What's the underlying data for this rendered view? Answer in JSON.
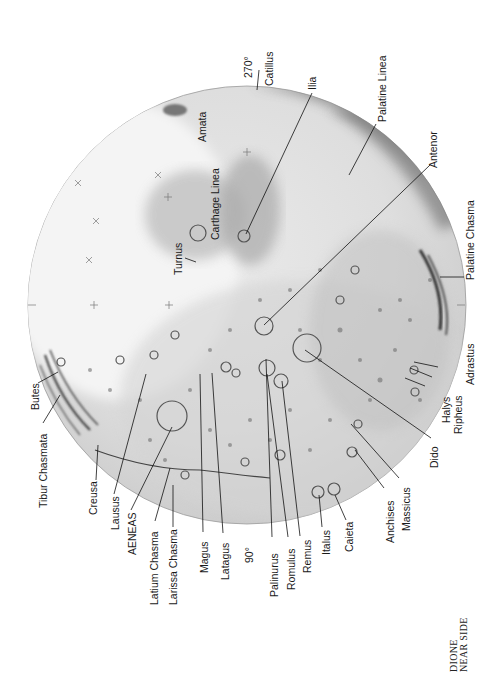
{
  "map": {
    "title_lines": [
      "DIONE",
      "NEAR SIDE"
    ],
    "body": "Dione",
    "orientation_note": "labels rotated 90° counter-clockwise",
    "longitude_marks": [
      {
        "id": "lon-270",
        "label": "270°"
      },
      {
        "id": "lon-90",
        "label": "90°"
      }
    ],
    "features": [
      {
        "id": "catillus",
        "label": "Catillus"
      },
      {
        "id": "ilia",
        "label": "Ilia"
      },
      {
        "id": "palatine-linea",
        "label": "Palatine Linea"
      },
      {
        "id": "antenor",
        "label": "Antenor"
      },
      {
        "id": "palatine-chasma",
        "label": "Palatine Chasma"
      },
      {
        "id": "adrastus",
        "label": "Adrastus"
      },
      {
        "id": "ripheus",
        "label": "Ripheus"
      },
      {
        "id": "halys",
        "label": "Halys"
      },
      {
        "id": "dido",
        "label": "Dido"
      },
      {
        "id": "massicus",
        "label": "Massicus"
      },
      {
        "id": "anchises",
        "label": "Anchises"
      },
      {
        "id": "caieta",
        "label": "Caieta"
      },
      {
        "id": "italus",
        "label": "Italus"
      },
      {
        "id": "remus",
        "label": "Remus"
      },
      {
        "id": "romulus",
        "label": "Romulus"
      },
      {
        "id": "palinurus",
        "label": "Palinurus"
      },
      {
        "id": "latagus",
        "label": "Latagus"
      },
      {
        "id": "magus",
        "label": "Magus"
      },
      {
        "id": "larissa-chasma",
        "label": "Larissa Chasma"
      },
      {
        "id": "latium-chasma",
        "label": "Latium Chasma"
      },
      {
        "id": "aeneas",
        "label": "AENEAS"
      },
      {
        "id": "lausus",
        "label": "Lausus"
      },
      {
        "id": "creusa",
        "label": "Creusa"
      },
      {
        "id": "tibur-chasmata",
        "label": "Tibur Chasmata"
      },
      {
        "id": "butes",
        "label": "Butes"
      },
      {
        "id": "turnus",
        "label": "Turnus"
      },
      {
        "id": "carthage-linea",
        "label": "Carthage Linea"
      },
      {
        "id": "amata",
        "label": "Amata"
      }
    ],
    "colors": {
      "background": "#ffffff",
      "disc_light": "#efefef",
      "disc_mid": "#cfcfcf",
      "disc_dark": "#8e8e8e",
      "ink": "#111111"
    }
  }
}
